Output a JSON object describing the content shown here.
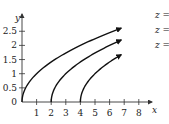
{
  "chart_data": {
    "type": "line",
    "title": "",
    "xlabel": "x",
    "ylabel": "y",
    "xlim": [
      0,
      8.5
    ],
    "ylim": [
      0,
      2.8
    ],
    "x_ticks": [
      "1",
      "2",
      "3",
      "4",
      "5",
      "6",
      "7",
      "8"
    ],
    "y_ticks": [
      "0",
      "0.5",
      "1",
      "1.5",
      "2",
      "2.5"
    ],
    "grid": false,
    "legend_position": "inline-right",
    "series": [
      {
        "name": "z = 0",
        "equation": "y = sqrt(x)",
        "x": [
          0,
          0.5,
          1,
          2,
          3,
          4,
          5,
          6,
          6.8
        ],
        "y": [
          0,
          0.71,
          1,
          1.41,
          1.73,
          2,
          2.24,
          2.45,
          2.61
        ]
      },
      {
        "name": "z = 2",
        "equation": "y = sqrt(x - 2)",
        "x": [
          2,
          2.5,
          3,
          4,
          5,
          6,
          6.8
        ],
        "y": [
          0,
          0.71,
          1,
          1.41,
          1.73,
          2,
          2.19
        ]
      },
      {
        "name": "z = 4",
        "equation": "y = sqrt(x - 4)",
        "x": [
          4,
          4.5,
          5,
          6,
          6.8
        ],
        "y": [
          0,
          0.71,
          1,
          1.41,
          1.67
        ]
      }
    ]
  },
  "labels": {
    "x_axis": "x",
    "y_axis": "y",
    "origin": "0",
    "curves": [
      "z = 0",
      "z = 2",
      "z = 4"
    ]
  }
}
